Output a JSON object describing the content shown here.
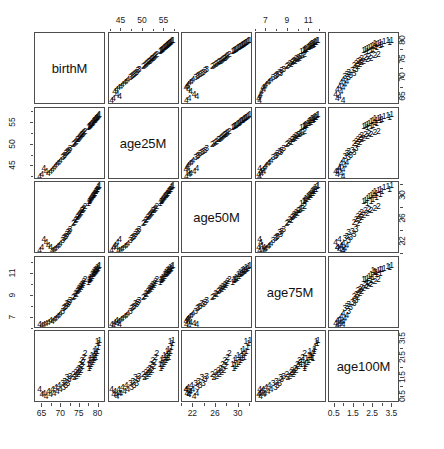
{
  "figure": {
    "type": "scatterplot-matrix",
    "title": "",
    "point_glyphs": [
      "1",
      "2",
      "3",
      "4"
    ],
    "background": "#ffffff",
    "frame_color": "#4d4d4d",
    "text_color": "#111111"
  },
  "variables": [
    {
      "key": "birthM",
      "label": "birthM",
      "lim": [
        63.0,
        82.0
      ],
      "ticks": [
        65,
        70,
        75,
        80
      ],
      "minor_step": 2.5
    },
    {
      "key": "age25M",
      "label": "age25M",
      "lim": [
        42.0,
        58.5
      ],
      "ticks": [
        45,
        50,
        55
      ],
      "minor_step": 2.5
    },
    {
      "key": "age50M",
      "label": "age50M",
      "lim": [
        20.0,
        32.5
      ],
      "ticks": [
        22,
        26,
        30
      ],
      "minor_step": 2
    },
    {
      "key": "age75M",
      "label": "age75M",
      "lim": [
        6.0,
        12.6
      ],
      "ticks": [
        7,
        9,
        11
      ],
      "minor_step": 1
    },
    {
      "key": "age100M",
      "label": "age100M",
      "lim": [
        0.2,
        3.9
      ],
      "ticks": [
        0.5,
        1.5,
        2.5,
        3.5
      ],
      "minor_step": 0.5
    }
  ],
  "axis_placement": {
    "note": "R pairs() alternates axes: odd-index variables get top/left, even get bottom/right",
    "top_columns": [
      "age25M",
      "age75M"
    ],
    "bottom_columns": [
      "birthM",
      "age50M",
      "age100M"
    ],
    "left_rows": [
      "age25M",
      "age75M"
    ],
    "right_rows": [
      "birthM",
      "age50M",
      "age100M"
    ]
  },
  "chart_data": {
    "type": "scatter",
    "title": "",
    "xlabel": "",
    "ylabel": "",
    "matrix": true,
    "variables": [
      "birthM",
      "age25M",
      "age50M",
      "age75M",
      "age100M"
    ],
    "group_field": "group",
    "groups": [
      "1",
      "2",
      "3",
      "4"
    ],
    "axis_ranges": {
      "birthM": [
        63.0,
        82.0
      ],
      "age25M": [
        42.0,
        58.5
      ],
      "age50M": [
        20.0,
        32.5
      ],
      "age75M": [
        6.0,
        12.6
      ],
      "age100M": [
        0.2,
        3.9
      ]
    },
    "tick_labels": {
      "birthM": [
        65,
        70,
        75,
        80
      ],
      "age25M": [
        45,
        50,
        55
      ],
      "age50M": [
        22,
        26,
        30
      ],
      "age75M": [
        7,
        9,
        11
      ],
      "age100M": [
        0.5,
        1.5,
        2.5,
        3.5
      ]
    },
    "grid": false,
    "legend": "none",
    "columns": [
      "birthM",
      "age25M",
      "age50M",
      "age75M",
      "age100M",
      "group"
    ],
    "rows": [
      [
        80.3,
        57.0,
        31.9,
        11.8,
        3.3,
        "1"
      ],
      [
        80.1,
        56.8,
        31.7,
        11.6,
        3.1,
        "1"
      ],
      [
        79.9,
        56.6,
        31.5,
        11.5,
        2.9,
        "1"
      ],
      [
        79.8,
        56.5,
        31.4,
        11.7,
        3.4,
        "1"
      ],
      [
        79.6,
        56.3,
        31.2,
        11.4,
        2.8,
        "1"
      ],
      [
        79.5,
        56.2,
        31.1,
        11.3,
        2.6,
        "1"
      ],
      [
        79.4,
        56.1,
        31.0,
        11.5,
        3.0,
        "1"
      ],
      [
        79.2,
        55.9,
        30.8,
        11.2,
        2.7,
        "1"
      ],
      [
        79.1,
        55.8,
        30.7,
        11.4,
        2.5,
        "1"
      ],
      [
        79.0,
        55.7,
        30.6,
        11.1,
        2.9,
        "1"
      ],
      [
        78.8,
        55.5,
        30.4,
        11.0,
        2.4,
        "1"
      ],
      [
        78.7,
        55.4,
        30.3,
        11.2,
        2.6,
        "1"
      ],
      [
        78.5,
        55.2,
        30.1,
        10.9,
        2.3,
        "1"
      ],
      [
        78.4,
        55.1,
        30.0,
        11.0,
        2.7,
        "1"
      ],
      [
        78.2,
        54.9,
        29.8,
        10.7,
        2.2,
        "1"
      ],
      [
        78.0,
        54.7,
        29.6,
        10.8,
        2.5,
        "1"
      ],
      [
        77.9,
        54.6,
        29.5,
        10.6,
        2.1,
        "1"
      ],
      [
        77.7,
        54.4,
        29.3,
        10.5,
        2.4,
        "1"
      ],
      [
        77.6,
        54.3,
        29.2,
        10.6,
        2.0,
        "1"
      ],
      [
        77.4,
        54.1,
        29.0,
        10.3,
        2.2,
        "1"
      ],
      [
        80.5,
        57.2,
        32.1,
        11.9,
        3.5,
        "1"
      ],
      [
        76.2,
        53.0,
        28.1,
        10.4,
        2.6,
        "2"
      ],
      [
        76.0,
        52.8,
        27.9,
        10.2,
        2.3,
        "2"
      ],
      [
        75.8,
        52.6,
        27.7,
        10.0,
        2.1,
        "2"
      ],
      [
        75.6,
        52.4,
        27.6,
        10.1,
        2.4,
        "2"
      ],
      [
        75.4,
        52.2,
        27.4,
        9.8,
        1.9,
        "2"
      ],
      [
        75.2,
        52.0,
        27.2,
        9.9,
        2.2,
        "2"
      ],
      [
        75.0,
        51.8,
        27.0,
        9.6,
        1.8,
        "2"
      ],
      [
        74.8,
        51.6,
        26.8,
        9.7,
        2.0,
        "2"
      ],
      [
        74.6,
        51.4,
        26.6,
        9.5,
        1.7,
        "2"
      ],
      [
        74.4,
        51.2,
        26.4,
        9.4,
        1.9,
        "2"
      ],
      [
        74.1,
        50.9,
        26.1,
        9.2,
        1.6,
        "2"
      ],
      [
        73.9,
        50.7,
        25.9,
        9.3,
        1.8,
        "2"
      ],
      [
        73.6,
        50.4,
        25.6,
        9.0,
        1.5,
        "2"
      ],
      [
        73.3,
        50.1,
        25.3,
        8.9,
        1.7,
        "2"
      ],
      [
        76.5,
        53.3,
        28.4,
        10.6,
        2.8,
        "2"
      ],
      [
        72.1,
        48.8,
        24.0,
        8.4,
        1.4,
        "3"
      ],
      [
        71.8,
        48.5,
        23.7,
        8.2,
        1.2,
        "3"
      ],
      [
        71.5,
        48.2,
        23.4,
        8.3,
        1.5,
        "3"
      ],
      [
        71.2,
        47.9,
        23.1,
        8.0,
        1.1,
        "3"
      ],
      [
        70.9,
        47.6,
        22.8,
        7.9,
        1.3,
        "3"
      ],
      [
        70.6,
        47.3,
        22.6,
        7.8,
        1.0,
        "3"
      ],
      [
        70.3,
        47.0,
        22.3,
        7.6,
        1.2,
        "3"
      ],
      [
        72.4,
        49.1,
        24.3,
        8.6,
        1.6,
        "3"
      ],
      [
        69.7,
        46.4,
        21.8,
        7.4,
        0.9,
        "4"
      ],
      [
        69.3,
        46.0,
        21.5,
        7.2,
        1.1,
        "4"
      ],
      [
        68.9,
        45.6,
        21.2,
        7.1,
        0.8,
        "4"
      ],
      [
        68.4,
        45.1,
        20.9,
        6.9,
        1.0,
        "4"
      ],
      [
        68.0,
        44.7,
        20.7,
        6.8,
        0.7,
        "4"
      ],
      [
        67.5,
        44.2,
        20.5,
        6.6,
        0.9,
        "4"
      ],
      [
        67.0,
        43.7,
        21.0,
        6.7,
        0.6,
        "4"
      ],
      [
        66.4,
        43.2,
        21.4,
        6.5,
        0.8,
        "4"
      ],
      [
        65.8,
        43.8,
        22.0,
        6.4,
        0.5,
        "4"
      ],
      [
        65.2,
        44.4,
        22.5,
        6.3,
        0.7,
        "4"
      ],
      [
        64.6,
        43.0,
        21.1,
        6.2,
        0.6,
        "4"
      ],
      [
        64.0,
        42.5,
        20.6,
        6.3,
        0.9,
        "4"
      ]
    ]
  }
}
